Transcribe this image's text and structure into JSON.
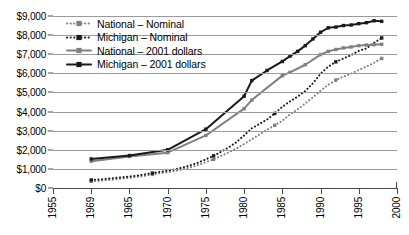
{
  "chart_data": {
    "type": "line",
    "title": "",
    "subtitle": "",
    "xlabel": "",
    "ylabel": "",
    "xlim": [
      1955,
      2000
    ],
    "ylim": [
      0,
      9000
    ],
    "grid": true,
    "legend_position": "upper-left",
    "y_ticks": [
      {
        "value": 0,
        "label": "$0"
      },
      {
        "value": 1000,
        "label": "$1,000"
      },
      {
        "value": 2000,
        "label": "$2,000"
      },
      {
        "value": 3000,
        "label": "$3,000"
      },
      {
        "value": 4000,
        "label": "$4,000"
      },
      {
        "value": 5000,
        "label": "$5,000"
      },
      {
        "value": 6000,
        "label": "$6,000"
      },
      {
        "value": 7000,
        "label": "$7,000"
      },
      {
        "value": 8000,
        "label": "$8,000"
      },
      {
        "value": 9000,
        "label": "$9,000"
      }
    ],
    "x_ticks": [
      {
        "value": 1955,
        "label": "1955"
      },
      {
        "value": 1960,
        "label": "1969"
      },
      {
        "value": 1965,
        "label": "1965"
      },
      {
        "value": 1970,
        "label": "1970"
      },
      {
        "value": 1975,
        "label": "1975"
      },
      {
        "value": 1980,
        "label": "1980"
      },
      {
        "value": 1985,
        "label": "1985"
      },
      {
        "value": 1990,
        "label": "1990"
      },
      {
        "value": 1995,
        "label": "1995"
      },
      {
        "value": 2000,
        "label": "2000"
      }
    ],
    "series": [
      {
        "name": "National – Nominal",
        "color": "#808080",
        "style": "dotted",
        "marker": "square",
        "points": [
          [
            1960,
            350
          ],
          [
            1961,
            380
          ],
          [
            1962,
            410
          ],
          [
            1963,
            450
          ],
          [
            1964,
            490
          ],
          [
            1965,
            530
          ],
          [
            1966,
            580
          ],
          [
            1967,
            640
          ],
          [
            1968,
            710
          ],
          [
            1969,
            780
          ],
          [
            1970,
            820
          ],
          [
            1971,
            900
          ],
          [
            1972,
            990
          ],
          [
            1973,
            1080
          ],
          [
            1974,
            1200
          ],
          [
            1975,
            1350
          ],
          [
            1976,
            1500
          ],
          [
            1977,
            1680
          ],
          [
            1978,
            1870
          ],
          [
            1979,
            2070
          ],
          [
            1980,
            2300
          ],
          [
            1981,
            2550
          ],
          [
            1982,
            2800
          ],
          [
            1983,
            3050
          ],
          [
            1984,
            3280
          ],
          [
            1985,
            3520
          ],
          [
            1986,
            3850
          ],
          [
            1987,
            4120
          ],
          [
            1988,
            4420
          ],
          [
            1989,
            4750
          ],
          [
            1990,
            5090
          ],
          [
            1991,
            5400
          ],
          [
            1992,
            5650
          ],
          [
            1993,
            5830
          ],
          [
            1994,
            5980
          ],
          [
            1995,
            6180
          ],
          [
            1996,
            6350
          ],
          [
            1997,
            6550
          ],
          [
            1998,
            6780
          ]
        ]
      },
      {
        "name": "Michigan – Nominal",
        "color": "#1a1a1a",
        "style": "dotted",
        "marker": "square",
        "points": [
          [
            1960,
            420
          ],
          [
            1961,
            450
          ],
          [
            1962,
            480
          ],
          [
            1963,
            520
          ],
          [
            1964,
            560
          ],
          [
            1965,
            600
          ],
          [
            1966,
            650
          ],
          [
            1967,
            710
          ],
          [
            1968,
            780
          ],
          [
            1969,
            850
          ],
          [
            1970,
            900
          ],
          [
            1971,
            980
          ],
          [
            1972,
            1080
          ],
          [
            1973,
            1190
          ],
          [
            1974,
            1330
          ],
          [
            1975,
            1500
          ],
          [
            1976,
            1680
          ],
          [
            1977,
            1900
          ],
          [
            1978,
            2130
          ],
          [
            1979,
            2400
          ],
          [
            1980,
            2750
          ],
          [
            1981,
            3120
          ],
          [
            1982,
            3350
          ],
          [
            1983,
            3580
          ],
          [
            1984,
            3900
          ],
          [
            1985,
            4250
          ],
          [
            1986,
            4530
          ],
          [
            1987,
            4780
          ],
          [
            1988,
            5080
          ],
          [
            1989,
            5480
          ],
          [
            1990,
            5980
          ],
          [
            1991,
            6350
          ],
          [
            1992,
            6600
          ],
          [
            1993,
            6780
          ],
          [
            1994,
            6950
          ],
          [
            1995,
            7180
          ],
          [
            1996,
            7300
          ],
          [
            1997,
            7600
          ],
          [
            1998,
            7850
          ]
        ]
      },
      {
        "name": "National – 2001 dollars",
        "color": "#808080",
        "style": "solid",
        "marker": "square",
        "points": [
          [
            1960,
            1400
          ],
          [
            1965,
            1650
          ],
          [
            1970,
            1850
          ],
          [
            1975,
            2750
          ],
          [
            1980,
            4150
          ],
          [
            1981,
            4600
          ],
          [
            1985,
            5880
          ],
          [
            1986,
            6050
          ],
          [
            1988,
            6450
          ],
          [
            1990,
            6980
          ],
          [
            1991,
            7150
          ],
          [
            1992,
            7250
          ],
          [
            1993,
            7330
          ],
          [
            1994,
            7380
          ],
          [
            1995,
            7450
          ],
          [
            1996,
            7480
          ],
          [
            1997,
            7500
          ],
          [
            1998,
            7520
          ]
        ]
      },
      {
        "name": "Michigan – 2001 dollars",
        "color": "#1a1a1a",
        "style": "solid",
        "marker": "square",
        "points": [
          [
            1960,
            1520
          ],
          [
            1965,
            1700
          ],
          [
            1970,
            2000
          ],
          [
            1975,
            3080
          ],
          [
            1980,
            4800
          ],
          [
            1981,
            5620
          ],
          [
            1983,
            6150
          ],
          [
            1985,
            6620
          ],
          [
            1986,
            6900
          ],
          [
            1987,
            7150
          ],
          [
            1988,
            7450
          ],
          [
            1989,
            7800
          ],
          [
            1990,
            8150
          ],
          [
            1991,
            8380
          ],
          [
            1992,
            8420
          ],
          [
            1993,
            8500
          ],
          [
            1994,
            8530
          ],
          [
            1995,
            8600
          ],
          [
            1996,
            8650
          ],
          [
            1997,
            8750
          ],
          [
            1998,
            8720
          ]
        ]
      }
    ]
  },
  "legend": {
    "items": [
      {
        "label": "National – Nominal"
      },
      {
        "label": "Michigan – Nominal"
      },
      {
        "label": "National – 2001 dollars"
      },
      {
        "label": "Michigan – 2001 dollars"
      }
    ]
  }
}
